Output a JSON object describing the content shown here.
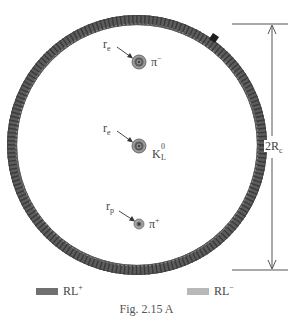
{
  "figure": {
    "caption": "Fig. 2.15 A",
    "ring": {
      "center_x": 137,
      "center_y": 145,
      "outer_radius": 130,
      "thickness": 10,
      "fill_color": "#666666",
      "stripe_color": "#3e3e3e",
      "highlight_color": "#8a8a8a",
      "dark_mark_color": "#222222"
    },
    "dimension": {
      "label_main": "2R",
      "label_sub": "c",
      "line_color": "#555555"
    },
    "particles": [
      {
        "name": "pi-minus",
        "symbol": "π",
        "sup": "−",
        "sub": "",
        "radius_label": "r",
        "radius_sub": "e",
        "cx": 139,
        "cy": 62,
        "outer_r": 7
      },
      {
        "name": "k-long",
        "symbol": "K",
        "sup": "0",
        "sub": "L",
        "radius_label": "r",
        "radius_sub": "e",
        "cx": 139,
        "cy": 146,
        "outer_r": 7
      },
      {
        "name": "pi-plus",
        "symbol": "π",
        "sup": "+",
        "sub": "",
        "radius_label": "r",
        "radius_sub": "p",
        "cx": 139,
        "cy": 224,
        "outer_r": 5
      }
    ],
    "legend": [
      {
        "label": "RL",
        "sup": "+",
        "color": "#707070"
      },
      {
        "label": "RL",
        "sup": "−",
        "color": "#b8b8b8"
      }
    ]
  }
}
